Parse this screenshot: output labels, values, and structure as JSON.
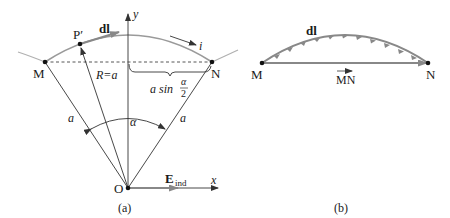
{
  "figure_a": {
    "caption": "(a)",
    "points": {
      "M": "M",
      "N": "N",
      "O": "O",
      "P_prime": "P′"
    },
    "labels": {
      "dl": "dl",
      "current": "i",
      "radius": "R=a",
      "half_chord_prefix": "a sin",
      "half_chord_num": "α",
      "half_chord_den": "2",
      "side_left": "a",
      "side_right": "a",
      "angle": "α",
      "field": "E",
      "field_sub": "ind",
      "x_axis": "x",
      "y_axis": "y"
    }
  },
  "figure_b": {
    "caption": "(b)",
    "points": {
      "M": "M",
      "N": "N"
    },
    "labels": {
      "dl": "dl",
      "chord": "MN"
    }
  },
  "colors": {
    "line": "#333333",
    "arc": "#999999",
    "vector": "#808080"
  }
}
